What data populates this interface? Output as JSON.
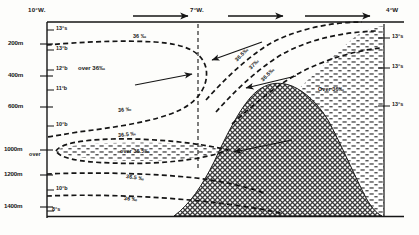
{
  "figure": {
    "type": "oceanographic-section"
  },
  "top_axis": {
    "name": "longitude-axis",
    "ticks": [
      {
        "label": "10°W.",
        "x": 8
      },
      {
        "label": "7°W.",
        "x": 198
      },
      {
        "label": "4°W",
        "x": 386
      }
    ],
    "flow_arrows": [
      {
        "name": "flow-arrow-1",
        "x1": 133,
        "x2": 190,
        "y": 16
      },
      {
        "name": "flow-arrow-2",
        "x1": 228,
        "x2": 285,
        "y": 16
      },
      {
        "name": "flow-arrow-3",
        "x1": 305,
        "x2": 372,
        "y": 16
      }
    ]
  },
  "left_axis": {
    "name": "depth-axis",
    "unit": "m",
    "ticks": [
      {
        "label": "200m",
        "y": 44
      },
      {
        "label": "400m",
        "y": 76
      },
      {
        "label": "600m",
        "y": 107
      },
      {
        "label": "1000m",
        "y": 150
      },
      {
        "label": "1200m",
        "y": 175
      },
      {
        "label": "1400m",
        "y": 207
      }
    ]
  },
  "left_temperatures": {
    "name": "left-temperature-labels",
    "items": [
      {
        "label": "13°s",
        "y": 28
      },
      {
        "label": "13°b",
        "y": 48
      },
      {
        "label": "12°b",
        "y": 68
      },
      {
        "label": "11°b",
        "y": 88
      },
      {
        "label": "10°b",
        "y": 124
      },
      {
        "label": "10°b",
        "y": 188
      },
      {
        "label": "8°s",
        "y": 210
      }
    ]
  },
  "right_temperatures": {
    "name": "right-temperature-labels",
    "items": [
      {
        "label": "13°s",
        "y": 36
      },
      {
        "label": "13°s",
        "y": 66
      },
      {
        "label": "13°s",
        "y": 104
      }
    ]
  },
  "contour_labels": [
    {
      "name": "salinity-contour-label-36-upper",
      "text": "36 ‰",
      "x": 133,
      "y": 38,
      "rot": 0
    },
    {
      "name": "salinity-region-over-36-left",
      "text": "over 36‰",
      "x": 78,
      "y": 68,
      "rot": 0
    },
    {
      "name": "salinity-contour-label-36-mid",
      "text": "36 ‰",
      "x": 118,
      "y": 111,
      "rot": -6
    },
    {
      "name": "salinity-contour-label-36-5-mid",
      "text": "36.5 ‰",
      "x": 118,
      "y": 136,
      "rot": -6
    },
    {
      "name": "salinity-region-over-left-core",
      "text": "over",
      "x": 30,
      "y": 155,
      "rot": 0
    },
    {
      "name": "salinity-region-over-36-5-core",
      "text": "over 36.5‰",
      "x": 120,
      "y": 155,
      "rot": 0
    },
    {
      "name": "salinity-contour-label-36-5-lower",
      "text": "36.5 ‰",
      "x": 126,
      "y": 177,
      "rot": 8
    },
    {
      "name": "salinity-contour-label-36-lower",
      "text": "36 ‰",
      "x": 124,
      "y": 199,
      "rot": 6
    },
    {
      "name": "salinity-contour-label-36-5-slope",
      "text": "36.5‰",
      "x": 242,
      "y": 60,
      "rot": -44
    },
    {
      "name": "salinity-contour-label-37-slope",
      "text": "37‰",
      "x": 252,
      "y": 68,
      "rot": -44
    },
    {
      "name": "salinity-contour-label-36-5-slope-2",
      "text": "36.5‰",
      "x": 264,
      "y": 80,
      "rot": -44
    },
    {
      "name": "salinity-region-over-36-right",
      "text": "Over 36‰",
      "x": 322,
      "y": 90,
      "rot": 0
    }
  ],
  "annotation_arrows": [
    {
      "name": "outflow-arrow-left",
      "x1": 168,
      "y1": 82,
      "x2": 228,
      "y2": 72
    },
    {
      "name": "inflow-arrow-upper",
      "x1": 258,
      "y1": 45,
      "x2": 212,
      "y2": 60
    },
    {
      "name": "inflow-arrow-lower",
      "x1": 298,
      "y1": 78,
      "x2": 246,
      "y2": 88
    },
    {
      "name": "core-arrow-lower",
      "x1": 290,
      "y1": 140,
      "x2": 232,
      "y2": 152
    }
  ],
  "colors": {
    "line": "#1a1a1a",
    "background": "#fdfdfb",
    "ridge_fill": "#7a7a7a",
    "water_mass_fill": "#555555"
  },
  "section_divider": {
    "name": "vertical-divider-7w",
    "x": 198
  }
}
